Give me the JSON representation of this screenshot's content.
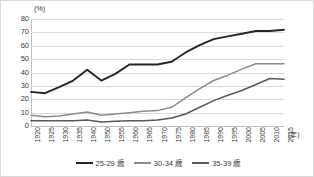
{
  "chart_data": {
    "type": "line",
    "title": "",
    "xlabel": "(年)",
    "ylabel": "(%)",
    "y_unit": "(%)",
    "x_unit": "(年)",
    "ylim": [
      0,
      80
    ],
    "yticks": [
      80,
      70,
      60,
      50,
      40,
      30,
      20,
      10,
      0
    ],
    "grid": true,
    "legend_position": "bottom",
    "categories": [
      "1920",
      "1925",
      "1930",
      "1935",
      "1940",
      "1950",
      "1955",
      "1960",
      "1965",
      "1970",
      "1975",
      "1980",
      "1985",
      "1990",
      "1995",
      "2000",
      "2005",
      "2010",
      "2015"
    ],
    "series": [
      {
        "name": "25-29 歳",
        "color": "#262626",
        "values": [
          25.5,
          24.5,
          29.0,
          34.0,
          42.0,
          34.0,
          39.0,
          46.0,
          46.0,
          46.0,
          48.0,
          55.0,
          60.5,
          65.0,
          67.0,
          69.0,
          71.0,
          71.0,
          72.0
        ]
      },
      {
        "name": "30-34 歳",
        "color": "#8c8c8c",
        "values": [
          8.0,
          7.0,
          7.5,
          9.0,
          10.5,
          8.0,
          9.0,
          10.0,
          11.0,
          11.5,
          14.0,
          21.0,
          28.0,
          34.0,
          38.0,
          42.5,
          46.5,
          46.5,
          46.5
        ]
      },
      {
        "name": "35-39 歳",
        "color": "#595959",
        "values": [
          4.0,
          4.0,
          4.0,
          4.0,
          4.5,
          3.0,
          3.5,
          4.0,
          4.0,
          4.5,
          6.0,
          9.0,
          14.0,
          19.0,
          23.0,
          26.5,
          31.0,
          35.5,
          35.0
        ]
      }
    ]
  },
  "colors": {
    "grid": "#d9d9d9",
    "axis": "#bfbfbf",
    "text": "#3b3b3b",
    "border": "#d9d9d9",
    "background": "#ffffff"
  }
}
